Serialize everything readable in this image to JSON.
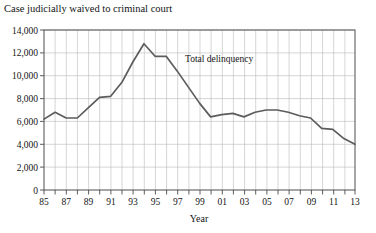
{
  "chart_data": {
    "type": "line",
    "title": "Case judicially waived to criminal court",
    "xlabel": "Year",
    "ylabel": "",
    "xlim": [
      1985,
      2013
    ],
    "ylim": [
      0,
      14000
    ],
    "grid": true,
    "legend_position": "inline-annotation",
    "y_ticks": [
      0,
      2000,
      4000,
      6000,
      8000,
      10000,
      12000,
      14000
    ],
    "y_tick_labels": [
      "0",
      "2,000",
      "4,000",
      "6,000",
      "8,000",
      "10,000",
      "12,000",
      "14,000"
    ],
    "x_ticks": [
      1985,
      1986,
      1987,
      1988,
      1989,
      1990,
      1991,
      1992,
      1993,
      1994,
      1995,
      1996,
      1997,
      1998,
      1999,
      2000,
      2001,
      2002,
      2003,
      2004,
      2005,
      2006,
      2007,
      2008,
      2009,
      2010,
      2011,
      2012,
      2013
    ],
    "x_tick_labels": [
      "85",
      "",
      "87",
      "",
      "89",
      "",
      "91",
      "",
      "93",
      "",
      "95",
      "",
      "97",
      "",
      "99",
      "",
      "01",
      "",
      "03",
      "",
      "05",
      "",
      "07",
      "",
      "09",
      "",
      "11",
      "",
      "13"
    ],
    "series": [
      {
        "name": "Total delinquency",
        "annotation": "Total delinquency",
        "color": "#5c5c5c",
        "x": [
          1985,
          1986,
          1987,
          1988,
          1989,
          1990,
          1991,
          1992,
          1993,
          1994,
          1995,
          1996,
          1997,
          1998,
          1999,
          2000,
          2001,
          2002,
          2003,
          2004,
          2005,
          2006,
          2007,
          2008,
          2009,
          2010,
          2011,
          2012,
          2013
        ],
        "values": [
          6200,
          6800,
          6300,
          6300,
          7200,
          8100,
          8200,
          9400,
          11200,
          12800,
          11700,
          11700,
          10400,
          9000,
          7600,
          6400,
          6600,
          6700,
          6400,
          6800,
          7000,
          7000,
          6800,
          6500,
          6300,
          5400,
          5300,
          4500,
          4000
        ]
      }
    ]
  }
}
